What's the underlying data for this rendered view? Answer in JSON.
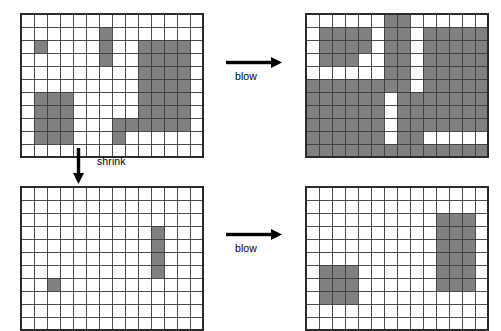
{
  "figure": {
    "title": "",
    "background_color": "#ffffff",
    "cell_fill_color": "#808080",
    "cell_empty_color": "#ffffff",
    "grid_line_color": "#3a3a3a",
    "border_color": "#2b2b2b"
  },
  "arrows": [
    {
      "id": "arrow-top-blow",
      "label": "blow",
      "direction": "right",
      "x": 226,
      "y": 56,
      "length": 56,
      "label_x": 235,
      "label_y": 70
    },
    {
      "id": "arrow-shrink",
      "label": "shrink",
      "direction": "down",
      "x": 72,
      "y": 148,
      "length": 36,
      "label_x": 97,
      "label_y": 155
    },
    {
      "id": "arrow-bottom-blow",
      "label": "blow",
      "direction": "right",
      "x": 226,
      "y": 228,
      "length": 56,
      "label_x": 235,
      "label_y": 242
    }
  ],
  "grids": [
    {
      "id": "grid-original",
      "name": "original-grid",
      "position": "top-left",
      "x": 20,
      "y": 13,
      "cols": 14,
      "rows": 11,
      "cell": 13,
      "filled": [
        [
          2,
          1
        ],
        [
          1,
          6
        ],
        [
          2,
          6
        ],
        [
          3,
          6
        ],
        [
          2,
          9
        ],
        [
          2,
          10
        ],
        [
          2,
          11
        ],
        [
          2,
          12
        ],
        [
          3,
          9
        ],
        [
          3,
          10
        ],
        [
          3,
          11
        ],
        [
          3,
          12
        ],
        [
          4,
          9
        ],
        [
          4,
          10
        ],
        [
          4,
          11
        ],
        [
          4,
          12
        ],
        [
          5,
          9
        ],
        [
          5,
          10
        ],
        [
          5,
          11
        ],
        [
          5,
          12
        ],
        [
          6,
          1
        ],
        [
          6,
          2
        ],
        [
          6,
          3
        ],
        [
          6,
          9
        ],
        [
          6,
          10
        ],
        [
          6,
          11
        ],
        [
          6,
          12
        ],
        [
          7,
          1
        ],
        [
          7,
          2
        ],
        [
          7,
          3
        ],
        [
          7,
          9
        ],
        [
          7,
          10
        ],
        [
          7,
          11
        ],
        [
          7,
          12
        ],
        [
          8,
          1
        ],
        [
          8,
          2
        ],
        [
          8,
          3
        ],
        [
          8,
          7
        ],
        [
          8,
          8
        ],
        [
          8,
          9
        ],
        [
          8,
          10
        ],
        [
          8,
          11
        ],
        [
          8,
          12
        ],
        [
          9,
          1
        ],
        [
          9,
          2
        ],
        [
          9,
          3
        ],
        [
          9,
          7
        ]
      ]
    },
    {
      "id": "grid-original-blown",
      "name": "blown-original-grid",
      "position": "top-right",
      "x": 305,
      "y": 13,
      "cols": 14,
      "rows": 11,
      "cell": 13,
      "filled": [
        [
          0,
          6
        ],
        [
          0,
          7
        ],
        [
          1,
          1
        ],
        [
          1,
          2
        ],
        [
          1,
          3
        ],
        [
          1,
          4
        ],
        [
          1,
          6
        ],
        [
          1,
          7
        ],
        [
          1,
          9
        ],
        [
          1,
          10
        ],
        [
          1,
          11
        ],
        [
          1,
          12
        ],
        [
          1,
          13
        ],
        [
          2,
          1
        ],
        [
          2,
          2
        ],
        [
          2,
          3
        ],
        [
          2,
          4
        ],
        [
          2,
          6
        ],
        [
          2,
          7
        ],
        [
          2,
          9
        ],
        [
          2,
          10
        ],
        [
          2,
          11
        ],
        [
          2,
          12
        ],
        [
          2,
          13
        ],
        [
          3,
          1
        ],
        [
          3,
          2
        ],
        [
          3,
          3
        ],
        [
          3,
          6
        ],
        [
          3,
          7
        ],
        [
          3,
          9
        ],
        [
          3,
          10
        ],
        [
          3,
          11
        ],
        [
          3,
          12
        ],
        [
          3,
          13
        ],
        [
          4,
          6
        ],
        [
          4,
          7
        ],
        [
          4,
          9
        ],
        [
          4,
          10
        ],
        [
          4,
          11
        ],
        [
          4,
          12
        ],
        [
          4,
          13
        ],
        [
          5,
          0
        ],
        [
          5,
          1
        ],
        [
          5,
          2
        ],
        [
          5,
          3
        ],
        [
          5,
          4
        ],
        [
          5,
          5
        ],
        [
          5,
          6
        ],
        [
          5,
          7
        ],
        [
          5,
          9
        ],
        [
          5,
          10
        ],
        [
          5,
          11
        ],
        [
          5,
          12
        ],
        [
          5,
          13
        ],
        [
          6,
          0
        ],
        [
          6,
          1
        ],
        [
          6,
          2
        ],
        [
          6,
          3
        ],
        [
          6,
          4
        ],
        [
          6,
          5
        ],
        [
          6,
          7
        ],
        [
          6,
          8
        ],
        [
          6,
          9
        ],
        [
          6,
          10
        ],
        [
          6,
          11
        ],
        [
          6,
          12
        ],
        [
          6,
          13
        ],
        [
          7,
          0
        ],
        [
          7,
          1
        ],
        [
          7,
          2
        ],
        [
          7,
          3
        ],
        [
          7,
          4
        ],
        [
          7,
          5
        ],
        [
          7,
          7
        ],
        [
          7,
          8
        ],
        [
          7,
          9
        ],
        [
          7,
          10
        ],
        [
          7,
          11
        ],
        [
          7,
          12
        ],
        [
          7,
          13
        ],
        [
          8,
          0
        ],
        [
          8,
          1
        ],
        [
          8,
          2
        ],
        [
          8,
          3
        ],
        [
          8,
          4
        ],
        [
          8,
          5
        ],
        [
          8,
          7
        ],
        [
          8,
          8
        ],
        [
          8,
          9
        ],
        [
          8,
          10
        ],
        [
          8,
          11
        ],
        [
          8,
          12
        ],
        [
          8,
          13
        ],
        [
          9,
          0
        ],
        [
          9,
          1
        ],
        [
          9,
          2
        ],
        [
          9,
          3
        ],
        [
          9,
          4
        ],
        [
          9,
          5
        ],
        [
          9,
          7
        ],
        [
          9,
          8
        ],
        [
          10,
          0
        ],
        [
          10,
          1
        ],
        [
          10,
          2
        ],
        [
          10,
          3
        ],
        [
          10,
          4
        ],
        [
          10,
          5
        ],
        [
          10,
          6
        ],
        [
          10,
          7
        ],
        [
          10,
          8
        ],
        [
          10,
          9
        ],
        [
          10,
          10
        ],
        [
          10,
          11
        ],
        [
          10,
          12
        ],
        [
          10,
          13
        ]
      ]
    },
    {
      "id": "grid-shrunk",
      "name": "shrunk-grid",
      "position": "bottom-left",
      "x": 20,
      "y": 186,
      "cols": 14,
      "rows": 11,
      "cell": 13,
      "filled": [
        [
          3,
          10
        ],
        [
          4,
          10
        ],
        [
          5,
          10
        ],
        [
          6,
          10
        ],
        [
          7,
          2
        ]
      ]
    },
    {
      "id": "grid-shrunk-blown",
      "name": "blown-shrunk-grid",
      "position": "bottom-right",
      "x": 305,
      "y": 186,
      "cols": 14,
      "rows": 11,
      "cell": 13,
      "filled": [
        [
          2,
          10
        ],
        [
          2,
          11
        ],
        [
          2,
          12
        ],
        [
          3,
          10
        ],
        [
          3,
          11
        ],
        [
          3,
          12
        ],
        [
          4,
          10
        ],
        [
          4,
          11
        ],
        [
          4,
          12
        ],
        [
          5,
          10
        ],
        [
          5,
          11
        ],
        [
          5,
          12
        ],
        [
          6,
          1
        ],
        [
          6,
          2
        ],
        [
          6,
          3
        ],
        [
          6,
          10
        ],
        [
          6,
          11
        ],
        [
          6,
          12
        ],
        [
          7,
          1
        ],
        [
          7,
          2
        ],
        [
          7,
          3
        ],
        [
          7,
          10
        ],
        [
          7,
          11
        ],
        [
          7,
          12
        ],
        [
          8,
          1
        ],
        [
          8,
          2
        ],
        [
          8,
          3
        ]
      ]
    }
  ]
}
